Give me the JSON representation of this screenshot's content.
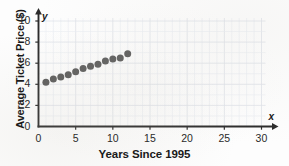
{
  "chart_data": {
    "type": "scatter",
    "title": "",
    "xlabel": "Years Since 1995",
    "ylabel": "Average Ticket Price ($)",
    "x_axis_variable": "x",
    "y_axis_variable": "y",
    "xlim": [
      0,
      30
    ],
    "ylim": [
      0,
      10
    ],
    "x_ticks": [
      0,
      5,
      10,
      15,
      20,
      25,
      30
    ],
    "y_ticks": [
      0,
      2,
      4,
      6,
      8,
      10
    ],
    "x_tick_labels": [
      "0",
      "5",
      "10",
      "15",
      "20",
      "25",
      "30"
    ],
    "y_tick_labels": [
      "0",
      "2",
      "4",
      "6",
      "8",
      "10"
    ],
    "grid": true,
    "grid_minor_step_x": 1,
    "grid_minor_step_y": 1,
    "legend": false,
    "marker": "filled-circle",
    "marker_color": "#565656",
    "marker_size": 4.4,
    "x": [
      1,
      2,
      3,
      4,
      5,
      6,
      7,
      8,
      9,
      10,
      11,
      12
    ],
    "values": [
      4.2,
      4.5,
      4.7,
      4.9,
      5.2,
      5.5,
      5.7,
      5.9,
      6.2,
      6.4,
      6.5,
      6.9
    ],
    "points": [
      {
        "x": 1,
        "y": 4.2
      },
      {
        "x": 2,
        "y": 4.5
      },
      {
        "x": 3,
        "y": 4.7
      },
      {
        "x": 4,
        "y": 4.9
      },
      {
        "x": 5,
        "y": 5.2
      },
      {
        "x": 6,
        "y": 5.5
      },
      {
        "x": 7,
        "y": 5.7
      },
      {
        "x": 8,
        "y": 5.9
      },
      {
        "x": 9,
        "y": 6.2
      },
      {
        "x": 10,
        "y": 6.4
      },
      {
        "x": 11,
        "y": 6.5
      },
      {
        "x": 12,
        "y": 6.9
      }
    ]
  },
  "colors": {
    "axis": "#2b2b2b",
    "marker": "#565656",
    "grid_minor": "#e9ecf2",
    "grid_major": "#dfe3ea",
    "text": "#1a1a1a",
    "background": "#fdfdfd"
  }
}
